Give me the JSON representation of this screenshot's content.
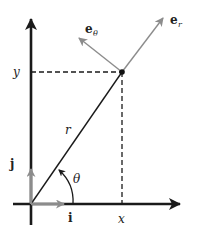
{
  "diagram": {
    "colors": {
      "axis": "#1a1a1a",
      "vector_gray": "#8c8c8c",
      "dashed": "#1a1a1a",
      "text": "#222222"
    },
    "labels": {
      "y_axis_value": "y",
      "x_axis_value": "x",
      "radius": "r",
      "angle": "θ",
      "unit_i": "i",
      "unit_j": "j",
      "e_r_base": "e",
      "e_r_sub": "r",
      "e_theta_base": "e",
      "e_theta_sub": "θ"
    },
    "geometry": {
      "origin": [
        31,
        204
      ],
      "point": [
        122,
        72
      ],
      "e_r_tip": [
        163,
        18
      ],
      "e_theta_tip": [
        79,
        38
      ],
      "i_tip": [
        63,
        204
      ],
      "j_tip": [
        31,
        170
      ]
    }
  }
}
